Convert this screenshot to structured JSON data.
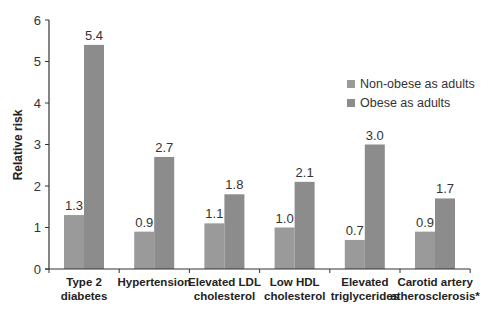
{
  "chart_data": {
    "type": "bar",
    "title": "",
    "xlabel": "",
    "ylabel": "Relative risk",
    "ylim": [
      0,
      6
    ],
    "yticks": [
      0,
      1,
      2,
      3,
      4,
      5,
      6
    ],
    "grid": false,
    "legend_position": "upper right",
    "categories": [
      [
        "Type 2",
        "diabetes"
      ],
      [
        "Hypertension"
      ],
      [
        "Elevated LDL",
        "cholesterol"
      ],
      [
        "Low HDL",
        "cholesterol"
      ],
      [
        "Elevated",
        "triglycerides"
      ],
      [
        "Carotid artery",
        "atherosclerosis*"
      ]
    ],
    "series": [
      {
        "name": "Non-obese as adults",
        "color": "#9a9a9a",
        "values": [
          1.3,
          0.9,
          1.1,
          1.0,
          0.7,
          0.9
        ],
        "labels": [
          "1.3",
          "0.9",
          "1.1",
          "1.0",
          "0.7",
          "0.9"
        ]
      },
      {
        "name": "Obese as adults",
        "color": "#8c8c8c",
        "values": [
          5.4,
          2.7,
          1.8,
          2.1,
          3.0,
          1.7
        ],
        "labels": [
          "5.4",
          "2.7",
          "1.8",
          "2.1",
          "3.0",
          "1.7"
        ]
      }
    ]
  }
}
